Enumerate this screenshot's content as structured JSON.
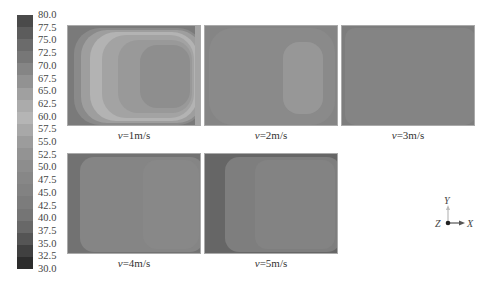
{
  "chart_data": {
    "type": "heatmap",
    "title": "",
    "colorbar": {
      "min": 30.0,
      "max": 80.0,
      "step": 2.5,
      "tick_labels": [
        "80.0",
        "77.5",
        "75.0",
        "72.5",
        "70.0",
        "67.5",
        "65.0",
        "62.5",
        "60.0",
        "57.5",
        "55.0",
        "52.5",
        "50.0",
        "47.5",
        "45.0",
        "42.5",
        "40.0",
        "37.5",
        "35.0",
        "32.5",
        "30.0"
      ],
      "colors": [
        "#4a4a4a",
        "#5c5c5c",
        "#6b6b6b",
        "#777777",
        "#858585",
        "#929292",
        "#a0a0a0",
        "#ababab",
        "#b5b5b5",
        "#a8a8a8",
        "#9c9c9c",
        "#939393",
        "#8d8d8d",
        "#878787",
        "#828282",
        "#7c7c7c",
        "#757575",
        "#686868",
        "#555555",
        "#404040",
        "#2c2c2c"
      ]
    },
    "panels": [
      {
        "label_var": "v",
        "label_val": "=1m/s",
        "description": "Strong gradient: dark left edge (~40), light bands (~60-65), central dark core region (~50)"
      },
      {
        "label_var": "v",
        "label_val": "=2m/s",
        "description": "Mostly uniform (~47.5), slightly lighter elongated region on right (~50)"
      },
      {
        "label_var": "v",
        "label_val": "=3m/s",
        "description": "Near uniform (~45), darker corners"
      },
      {
        "label_var": "v",
        "label_val": "=4m/s",
        "description": "Near uniform (~45), darker left edge (~40)"
      },
      {
        "label_var": "v",
        "label_val": "=5m/s",
        "description": "Dark left band (~37.5), lighter rounded region right (~45)"
      }
    ],
    "axes_triad": {
      "y_label": "Y",
      "z_label": "Z",
      "x_label": "X"
    }
  },
  "captions": {
    "p1": {
      "var": "v",
      "val": "=1m/s"
    },
    "p2": {
      "var": "v",
      "val": "=2m/s"
    },
    "p3": {
      "var": "v",
      "val": "=3m/s"
    },
    "p4": {
      "var": "v",
      "val": "=4m/s"
    },
    "p5": {
      "var": "v",
      "val": "=5m/s"
    }
  },
  "triad": {
    "y": "Y",
    "z": "Z",
    "x": "X"
  }
}
